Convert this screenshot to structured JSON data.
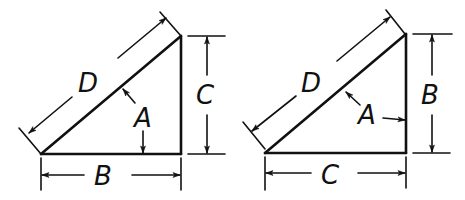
{
  "diagram": {
    "background": "#ffffff",
    "ink_color": "#111111",
    "figures": [
      {
        "id": "left-triangle",
        "vertices": {
          "bottom_left": [
            41,
            154
          ],
          "right_angle": [
            181,
            154
          ],
          "top": [
            181,
            36
          ]
        },
        "labels": {
          "hypotenuse": "D",
          "base": "B",
          "height": "C",
          "angle": "A"
        },
        "angle_reference": "between hypotenuse and base"
      },
      {
        "id": "right-triangle",
        "vertices": {
          "bottom_left": [
            265,
            153
          ],
          "right_angle": [
            406,
            153
          ],
          "top": [
            406,
            34
          ]
        },
        "labels": {
          "hypotenuse": "D",
          "base": "C",
          "height": "B",
          "angle": "A"
        },
        "angle_reference": "between hypotenuse and vertical side"
      }
    ]
  }
}
